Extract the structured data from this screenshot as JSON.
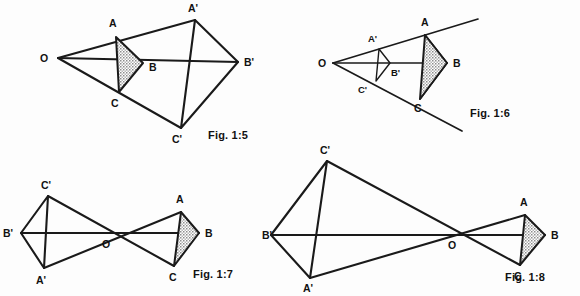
{
  "sheet": {
    "title": "Geometric similarity and point-reflection constructions",
    "background_color": "#fdfdfd",
    "ink_color": "#1a1a1a",
    "shade_color": "#9a9a9a",
    "width": 580,
    "height": 296
  },
  "figures": [
    {
      "id": "fig-1-5",
      "caption": "Fig. 1:5",
      "caption_pos": {
        "x": 208,
        "y": 139
      },
      "description": "Enlargement from centre O, positive scale factor, image A'B'C' outside triangle ABC",
      "center": {
        "label": "O",
        "x": 58,
        "y": 58,
        "label_x": 40,
        "label_y": 62
      },
      "triangle": {
        "name": "ABC",
        "shaded": true,
        "vertices": [
          {
            "label": "A",
            "x": 116,
            "y": 37,
            "label_x": 109,
            "label_y": 27
          },
          {
            "label": "B",
            "x": 143,
            "y": 63,
            "label_x": 149,
            "label_y": 71
          },
          {
            "label": "C",
            "x": 119,
            "y": 92,
            "label_x": 111,
            "label_y": 107
          }
        ]
      },
      "image_triangle": {
        "name": "A'B'C'",
        "shaded": false,
        "vertices": [
          {
            "label": "A'",
            "x": 195,
            "y": 20,
            "label_x": 188,
            "label_y": 12
          },
          {
            "label": "B'",
            "x": 238,
            "y": 62,
            "label_x": 244,
            "label_y": 66
          },
          {
            "label": "C'",
            "x": 181,
            "y": 128,
            "label_x": 172,
            "label_y": 143
          }
        ]
      },
      "rays": [
        {
          "from": "O",
          "to": "A'"
        },
        {
          "from": "O",
          "to": "B'"
        },
        {
          "from": "O",
          "to": "C'"
        }
      ]
    },
    {
      "id": "fig-1-6",
      "caption": "Fig. 1:6",
      "caption_pos": {
        "x": 470,
        "y": 117
      },
      "description": "Reduction from centre O, positive scale factor less than one, image A'B'C' inside triangle ABC, rays drawn as extended straight lines",
      "center": {
        "label": "O",
        "x": 333,
        "y": 63
      },
      "center_label_pos": {
        "x": 318,
        "y": 67
      },
      "triangle": {
        "name": "ABC",
        "shaded": true,
        "vertices": [
          {
            "label": "A",
            "x": 425,
            "y": 35,
            "label_x": 421,
            "label_y": 26
          },
          {
            "label": "B",
            "x": 447,
            "y": 63,
            "label_x": 453,
            "label_y": 67
          },
          {
            "label": "C",
            "x": 420,
            "y": 99,
            "label_x": 414,
            "label_y": 112
          }
        ]
      },
      "image_triangle": {
        "name": "A'B'C'",
        "shaded": false,
        "vertices": [
          {
            "label": "A'",
            "x": 379,
            "y": 49,
            "label_x": 368,
            "label_y": 42
          },
          {
            "label": "B'",
            "x": 390,
            "y": 63,
            "label_x": 391,
            "label_y": 76
          },
          {
            "label": "C'",
            "x": 376,
            "y": 81,
            "label_x": 358,
            "label_y": 93
          }
        ]
      },
      "extended_rays": [
        {
          "from": {
            "x": 333,
            "y": 63
          },
          "to": {
            "x": 478,
            "y": 19
          }
        },
        {
          "from": {
            "x": 333,
            "y": 63
          },
          "to": {
            "x": 462,
            "y": 131
          }
        }
      ]
    },
    {
      "id": "fig-1-7",
      "caption": "Fig. 1:7",
      "caption_pos": {
        "x": 193,
        "y": 278
      },
      "description": "Point reflection through O, negative scale factor of magnitude about one, image A'B'C' on opposite side of O",
      "center": {
        "label": "O",
        "x": 108,
        "y": 234,
        "label_x": 102,
        "label_y": 248
      },
      "triangle": {
        "name": "ABC",
        "shaded": true,
        "vertices": [
          {
            "label": "A",
            "x": 181,
            "y": 212,
            "label_x": 176,
            "label_y": 203
          },
          {
            "label": "B",
            "x": 199,
            "y": 233,
            "label_x": 205,
            "label_y": 237
          },
          {
            "label": "C",
            "x": 174,
            "y": 266,
            "label_x": 169,
            "label_y": 281
          }
        ]
      },
      "image_triangle": {
        "name": "A'B'C'",
        "shaded": false,
        "vertices": [
          {
            "label": "A'",
            "x": 44,
            "y": 268,
            "label_x": 36,
            "label_y": 284
          },
          {
            "label": "B'",
            "x": 21,
            "y": 233,
            "label_x": 3,
            "label_y": 237
          },
          {
            "label": "C'",
            "x": 48,
            "y": 196,
            "label_x": 41,
            "label_y": 189
          }
        ]
      }
    },
    {
      "id": "fig-1-8",
      "caption": "Fig. 1:8",
      "caption_pos": {
        "x": 505,
        "y": 281
      },
      "description": "Point reflection through O with negative scale factor of larger magnitude, image A'B'C' enlarged on opposite side of O",
      "center": {
        "label": "O",
        "x": 452,
        "y": 235,
        "label_x": 448,
        "label_y": 249
      },
      "triangle": {
        "name": "ABC",
        "shaded": true,
        "vertices": [
          {
            "label": "A",
            "x": 525,
            "y": 215,
            "label_x": 520,
            "label_y": 206
          },
          {
            "label": "B",
            "x": 545,
            "y": 235,
            "label_x": 551,
            "label_y": 239
          },
          {
            "label": "C",
            "x": 520,
            "y": 265,
            "label_x": 514,
            "label_y": 280
          }
        ]
      },
      "image_triangle": {
        "name": "A'B'C'",
        "shaded": false,
        "vertices": [
          {
            "label": "A'",
            "x": 310,
            "y": 278,
            "label_x": 303,
            "label_y": 292
          },
          {
            "label": "B'",
            "x": 271,
            "y": 235,
            "label_x": 262,
            "label_y": 239
          },
          {
            "label": "C'",
            "x": 327,
            "y": 161,
            "label_x": 320,
            "label_y": 154
          }
        ]
      }
    }
  ]
}
